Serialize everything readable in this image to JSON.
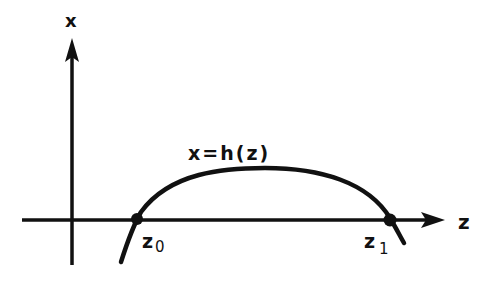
{
  "diagram": {
    "axes": {
      "vertical_label": "x",
      "horizontal_label": "z"
    },
    "curve": {
      "label": "x=h(z)"
    },
    "points": [
      {
        "label_base": "z",
        "label_sub": "0"
      },
      {
        "label_base": "z",
        "label_sub": "1"
      }
    ],
    "colors": {
      "ink": "#111111",
      "background": "#ffffff"
    }
  }
}
